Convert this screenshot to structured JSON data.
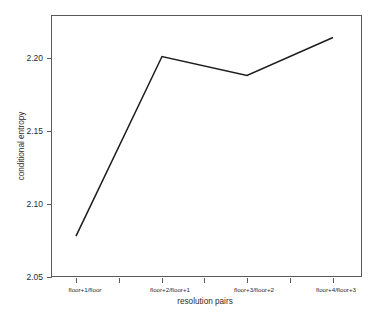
{
  "chart_data": {
    "type": "line",
    "title": "",
    "subtitle": "",
    "xlabel": "resolution pairs",
    "ylabel": "conditional entropy",
    "categories": [
      "floor+1/floor",
      "floor+2/floor+1",
      "floor+3/floor+2",
      "floor+4/floor+3"
    ],
    "values": [
      2.078,
      2.201,
      2.188,
      2.214
    ],
    "series": [
      {
        "name": "conditional entropy",
        "values": [
          2.078,
          2.201,
          2.188,
          2.214
        ]
      }
    ],
    "ylim": [
      2.05,
      2.2255
    ],
    "ytick_labels": [
      "2.05",
      "2.10",
      "2.15",
      "2.20"
    ],
    "ytick_values": [
      2.05,
      2.1,
      2.15,
      2.2
    ],
    "xtick_labels": [
      "floor+1/floor",
      "floor+2/floor+1",
      "floor+3/floor+2",
      "floor+4/floor+3"
    ],
    "grid": false,
    "legend": false,
    "legend_position": "none",
    "line_color": "#1c1c1c",
    "frame_color": "#5a5a5a",
    "background_color": "#ffffff",
    "markers": false,
    "annotations": []
  },
  "axes": {
    "y_label_text": "conditional entropy",
    "x_label_text": "resolution pairs"
  }
}
